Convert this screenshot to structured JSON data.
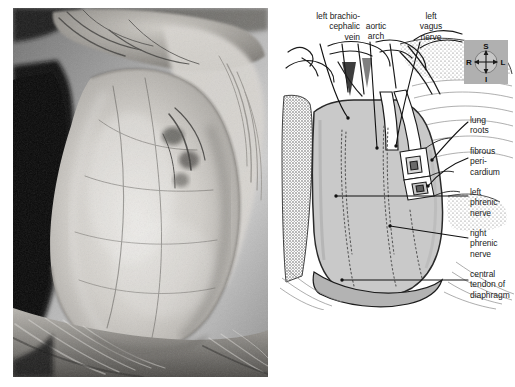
{
  "figure": {
    "kind": "anatomical-figure",
    "panels": [
      "dissection-photograph",
      "labelled-line-drawing"
    ]
  },
  "labels": {
    "top": [
      {
        "id": "left-brachiocephalic-vein",
        "text": "left brachio-\ncephalic\nvein",
        "align": "right"
      },
      {
        "id": "aortic-arch",
        "text": "aortic\narch",
        "align": "center"
      },
      {
        "id": "left-vagus-nerve",
        "text": "left\nvagus\nnerve",
        "align": "center"
      }
    ],
    "right": [
      {
        "id": "lung-roots",
        "text": "lung\nroots"
      },
      {
        "id": "fibrous-pericardium",
        "text": "fibrous\nperi-\ncardium"
      },
      {
        "id": "left-phrenic-nerve",
        "text": "left\nphrenic\nnerve"
      },
      {
        "id": "right-phrenic-nerve",
        "text": "right\nphrenic\nnerve"
      },
      {
        "id": "central-tendon-of-diaphragm",
        "text": "central\ntendon of\ndiaphragm"
      }
    ]
  },
  "compass": {
    "name": "orientation-compass",
    "superior": "S",
    "inferior": "I",
    "right": "R",
    "left": "L",
    "background": "#b0b0b0"
  },
  "colors": {
    "ink": "#1b1b1b",
    "pericardium_fill": "#c9c9c9",
    "lung_stipple": "#d6d6d6",
    "paper": "#ffffff",
    "photo_dark": "#0d0d0d",
    "photo_mid": "#8d8d8d",
    "photo_light": "#e2e2e2"
  }
}
